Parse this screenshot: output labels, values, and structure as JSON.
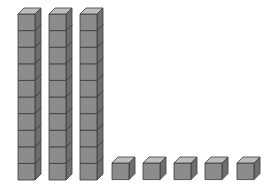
{
  "diagram": {
    "tens_rods": 3,
    "cubes_per_rod": 10,
    "ones_cubes": 5,
    "represented_value": 35,
    "colors": {
      "front": "#8c8c8c",
      "top": "#bdbdbd",
      "side": "#6e6e6e",
      "edge": "#3a3a3a",
      "background": "#ffffff"
    }
  }
}
